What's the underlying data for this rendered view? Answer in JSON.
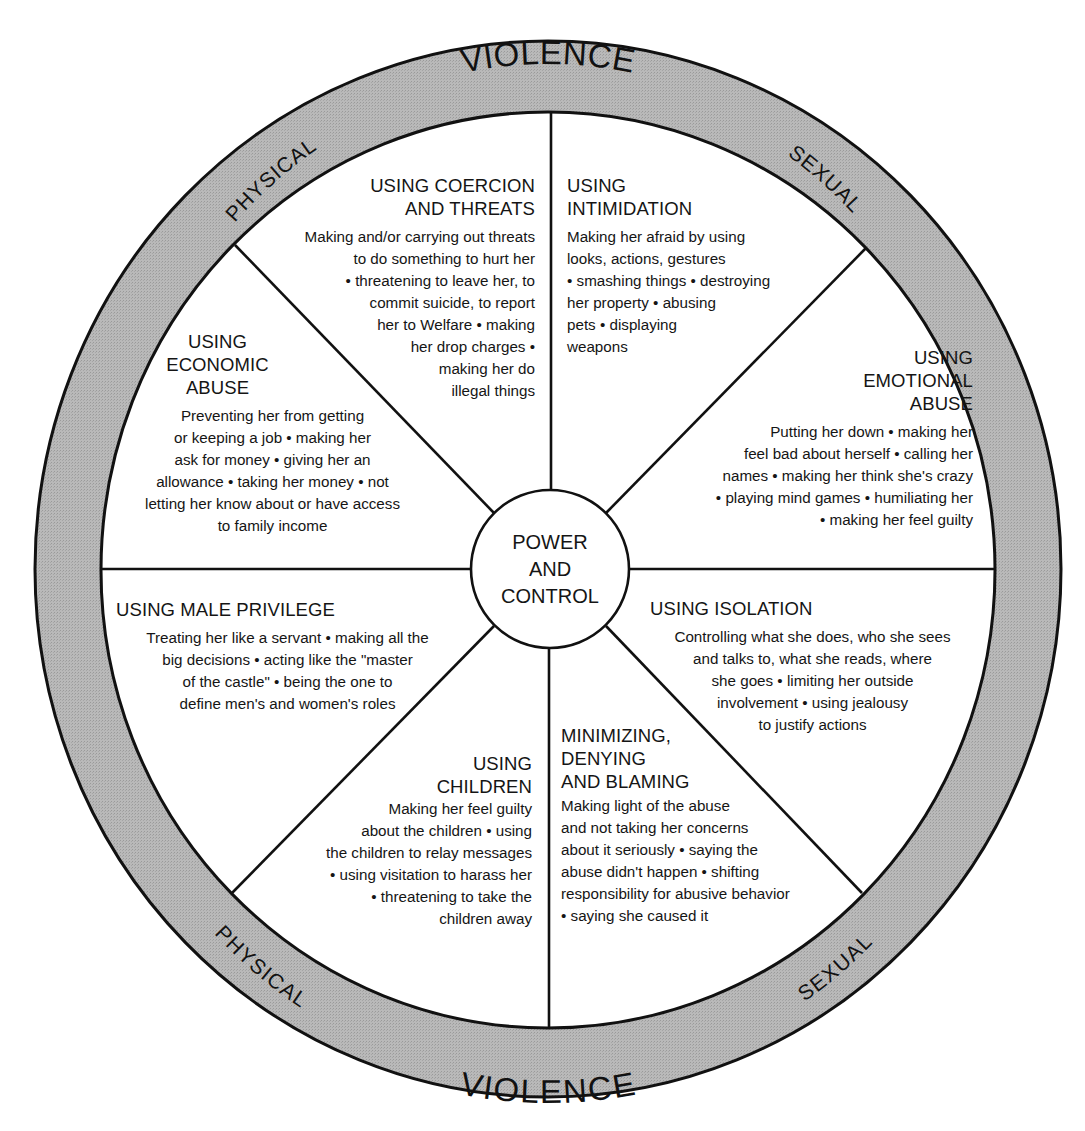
{
  "ring": {
    "top": {
      "left": "PHYSICAL",
      "center": "VIOLENCE",
      "right": "SEXUAL"
    },
    "bottom": {
      "left": "PHYSICAL",
      "center": "VIOLENCE",
      "right": "SEXUAL"
    },
    "fill_color": "#b4b4b4",
    "stroke_color": "#111111"
  },
  "hub": {
    "label": "POWER\nAND\nCONTROL"
  },
  "segments": [
    {
      "id": "coercion",
      "title": "USING COERCION\nAND THREATS",
      "body": "Making and/or carrying out threats\nto do something to hurt her\n• threatening to leave her, to\ncommit suicide, to report\nher to Welfare • making\nher drop charges •\nmaking her do\nillegal things"
    },
    {
      "id": "intimidation",
      "title": "USING\nINTIMIDATION",
      "body": "Making her afraid by using\nlooks, actions, gestures\n• smashing things • destroying\nher property • abusing\npets • displaying\nweapons"
    },
    {
      "id": "emotional",
      "title": "USING\nEMOTIONAL\nABUSE",
      "body": "Putting her down • making her\nfeel bad about herself • calling her\nnames • making her think she's crazy\n• playing mind games • humiliating her\n• making her feel guilty"
    },
    {
      "id": "isolation",
      "title": "USING ISOLATION",
      "body": "Controlling what she does, who she sees\nand talks to, what she reads, where\nshe goes • limiting her outside\ninvolvement • using jealousy\nto justify actions"
    },
    {
      "id": "minimizing",
      "title": "MINIMIZING,\nDENYING\nAND BLAMING",
      "body": "Making light of the abuse\nand not taking her concerns\nabout it seriously • saying the\nabuse didn't happen • shifting\nresponsibility for abusive behavior\n• saying she caused it"
    },
    {
      "id": "children",
      "title": "USING\nCHILDREN",
      "body": "Making her feel guilty\nabout the children • using\nthe children to relay messages\n• using visitation to harass her\n• threatening to take the\nchildren away"
    },
    {
      "id": "male-privilege",
      "title": "USING MALE PRIVILEGE",
      "body": "Treating her like a servant • making all the\nbig decisions • acting like the \"master\nof the castle\" • being the one to\ndefine men's and women's roles"
    },
    {
      "id": "economic",
      "title": "USING\nECONOMIC\nABUSE",
      "body": "Preventing her from getting\nor keeping a job • making her\nask for money • giving her an\nallowance • taking her money • not\nletting her know about or have access\nto family income"
    }
  ]
}
